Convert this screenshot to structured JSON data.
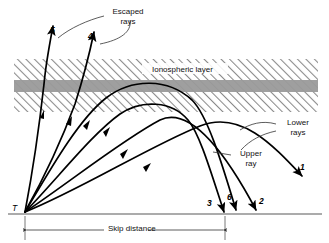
{
  "figure": {
    "background": "#ffffff",
    "ink": "#000000"
  },
  "layer": {
    "label": "Ionospheric layer",
    "hatch_color": "#8a8a8a",
    "dense_band_color": "#9a9a9a",
    "x": 14,
    "y": 59,
    "width": 304,
    "height": 53,
    "dense_band_y": 80,
    "dense_band_height": 12
  },
  "ground": {
    "label": "",
    "y": 214,
    "x_start": 8,
    "x_end": 322,
    "color": "#8f8f8f"
  },
  "transmitter": {
    "marker": "T",
    "x": 25,
    "y": 212
  },
  "annotations": [
    {
      "id": "escaped-rays",
      "text": "Escaped rays",
      "line1": "Escaped",
      "line2": "rays",
      "x": 106,
      "y": 8
    },
    {
      "id": "lower-rays",
      "text": "Lower rays",
      "line1": "Lower",
      "line2": "rays",
      "x": 278,
      "y": 121
    },
    {
      "id": "upper-ray",
      "text": "Upper ray",
      "line1": "Upper",
      "line2": "ray",
      "x": 232,
      "y": 152
    }
  ],
  "dimension": {
    "label": "Skip distance",
    "x_start": 25,
    "x_end": 225,
    "y": 230
  },
  "ray_labels": [
    {
      "id": "ray-5",
      "text": "5",
      "x": 50,
      "y": 29
    },
    {
      "id": "ray-4",
      "text": "4",
      "x": 88,
      "y": 35
    },
    {
      "id": "ray-1",
      "text": "1",
      "x": 300,
      "y": 166
    },
    {
      "id": "ray-3",
      "text": "3",
      "x": 207,
      "y": 202
    },
    {
      "id": "ray-6",
      "text": "6",
      "x": 227,
      "y": 196
    },
    {
      "id": "ray-2",
      "text": "2",
      "x": 259,
      "y": 200
    }
  ],
  "rays": {
    "count": 6,
    "escaped": [
      "5",
      "4"
    ],
    "returned": [
      "3",
      "6",
      "2",
      "1"
    ],
    "description": "Six rays launched from transmitter T at increasing elevation; rays 5 and 4 penetrate and escape the ionospheric layer, rays 1, 2, 3 and 6 are refracted back to ground."
  }
}
